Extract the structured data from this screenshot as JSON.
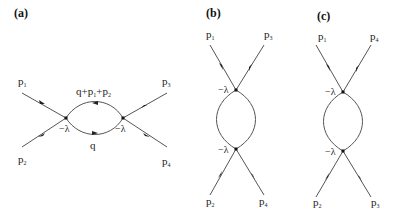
{
  "panels": [
    {
      "id": "a",
      "label": "(a)",
      "vertex_label": "−λ",
      "externals": [
        {
          "p": "p",
          "sub": "1"
        },
        {
          "p": "p",
          "sub": "2"
        },
        {
          "p": "p",
          "sub": "3"
        },
        {
          "p": "p",
          "sub": "4"
        }
      ],
      "loop_top": {
        "q": "q+p",
        "sub1": "1",
        "plus": "+p",
        "sub2": "2"
      },
      "loop_bottom": "q"
    },
    {
      "id": "b",
      "label": "(b)",
      "vertex_label": "−λ",
      "externals": [
        {
          "p": "p",
          "sub": "1"
        },
        {
          "p": "p",
          "sub": "3"
        },
        {
          "p": "p",
          "sub": "2"
        },
        {
          "p": "p",
          "sub": "4"
        }
      ]
    },
    {
      "id": "c",
      "label": "(c)",
      "vertex_label": "−λ",
      "externals": [
        {
          "p": "p",
          "sub": "1"
        },
        {
          "p": "p",
          "sub": "4"
        },
        {
          "p": "p",
          "sub": "2"
        },
        {
          "p": "p",
          "sub": "3"
        }
      ]
    }
  ]
}
